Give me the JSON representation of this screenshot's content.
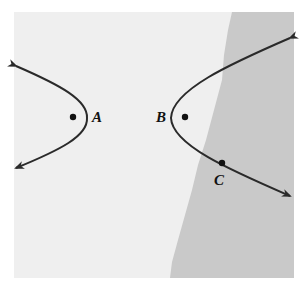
{
  "figure": {
    "points": [
      {
        "label": "A",
        "role": "focus of left branch"
      },
      {
        "label": "B",
        "role": "focus of right branch"
      },
      {
        "label": "C",
        "role": "point on right branch"
      }
    ],
    "colors": {
      "panel_light": "#efefef",
      "panel_dark": "#c8c8c8",
      "curve": "#2a2a2a"
    }
  }
}
